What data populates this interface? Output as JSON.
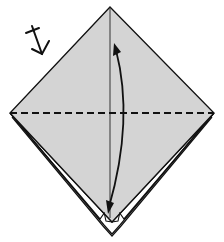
{
  "diagram": {
    "type": "origami-step",
    "paper_fill": "#d4d4d4",
    "line_color": "#111111",
    "background": "#ffffff",
    "shape": "square-diamond",
    "symbols": [
      {
        "name": "turn-over-symbol",
        "meaning": "turn over"
      },
      {
        "name": "valley-fold-line",
        "style": "dashed",
        "orientation": "horizontal"
      },
      {
        "name": "fold-arrow",
        "style": "curved, double-direction",
        "orientation": "vertical"
      },
      {
        "name": "center-crease",
        "style": "solid",
        "orientation": "vertical"
      },
      {
        "name": "layered-edges",
        "location": "lower edges"
      }
    ]
  }
}
